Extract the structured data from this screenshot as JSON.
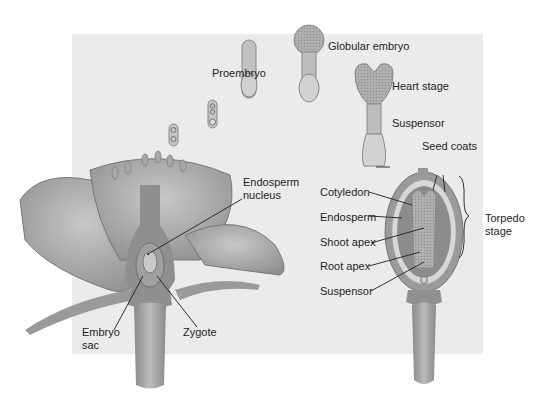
{
  "diagram": {
    "stages": [
      {
        "id": "proembryo",
        "label": "Proembryo"
      },
      {
        "id": "globular",
        "label": "Globular embryo"
      },
      {
        "id": "heart",
        "label": "Heart stage"
      },
      {
        "id": "torpedo",
        "label": "Torpedo stage"
      }
    ],
    "labels": {
      "proembryo": "Proembryo",
      "globular_embryo": "Globular embryo",
      "heart_stage": "Heart stage",
      "suspensor_heart": "Suspensor",
      "seed_coats": "Seed coats",
      "cotyledon": "Cotyledon",
      "endosperm": "Endosperm",
      "shoot_apex": "Shoot apex",
      "root_apex": "Root apex",
      "suspensor_torpedo": "Suspensor",
      "torpedo_stage": "Torpedo stage",
      "endosperm_nucleus": "Endosperm nucleus",
      "embryo_sac": "Embryo sac",
      "zygote": "Zygote"
    },
    "colors": {
      "background_panel": "#ebebeb",
      "petal": "#a8a8a8",
      "tissue_dark": "#8a8a8a",
      "embryo": "#b8b8b8",
      "leader_line": "#1e1e1e"
    }
  }
}
